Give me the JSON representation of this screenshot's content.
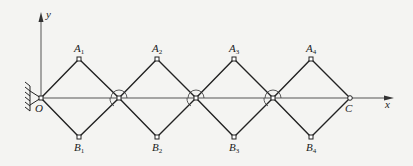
{
  "diagram": {
    "type": "scissor-linkage mechanism",
    "colors": {
      "line": "#222222",
      "axis": "#555555",
      "background": "#f4f4f2"
    },
    "axes": {
      "x_label": "x",
      "y_label": "y",
      "origin_label": "O"
    },
    "end_label": "C",
    "top_nodes": [
      {
        "label": "A",
        "sub": "1"
      },
      {
        "label": "A",
        "sub": "2"
      },
      {
        "label": "A",
        "sub": "3"
      },
      {
        "label": "A",
        "sub": "4"
      }
    ],
    "bottom_nodes": [
      {
        "label": "B",
        "sub": "1"
      },
      {
        "label": "B",
        "sub": "2"
      },
      {
        "label": "B",
        "sub": "3"
      },
      {
        "label": "B",
        "sub": "4"
      }
    ],
    "support": "fixed pin support at O (hatched wall)",
    "joint_markers": "angle arcs at 3 intermediate joints on x-axis"
  }
}
